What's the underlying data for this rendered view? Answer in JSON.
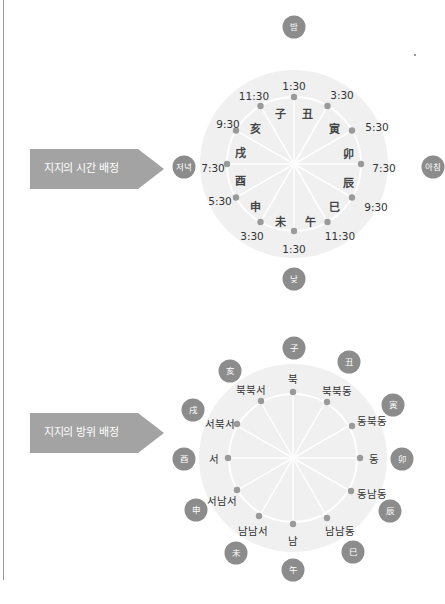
{
  "colors": {
    "disc": "#efefef",
    "ring": "#ffffff",
    "dot": "#9a9a9a",
    "badge": "#8c8c8c",
    "tag": "#a3a3a3"
  },
  "time_diagram": {
    "tag_label": "지지의 시간 배정",
    "poles": {
      "top": "밤",
      "right": "아침",
      "bottom": "낮",
      "left": "저녁"
    },
    "times": [
      "1:30",
      "3:30",
      "5:30",
      "7:30",
      "9:30",
      "11:30",
      "1:30",
      "3:30",
      "5:30",
      "7:30",
      "9:30",
      "11:30"
    ],
    "branches": [
      "丑",
      "寅",
      "卯",
      "辰",
      "巳",
      "午",
      "未",
      "申",
      "酉",
      "戌",
      "亥",
      "子"
    ]
  },
  "direction_diagram": {
    "tag_label": "지지의 방위 배정",
    "directions": [
      "북",
      "북북동",
      "동북동",
      "동",
      "동남동",
      "남남동",
      "남",
      "남남서",
      "서남서",
      "서",
      "서북서",
      "북북서"
    ],
    "branches": [
      "子",
      "丑",
      "寅",
      "卯",
      "辰",
      "巳",
      "午",
      "未",
      "申",
      "酉",
      "戌",
      "亥"
    ]
  }
}
